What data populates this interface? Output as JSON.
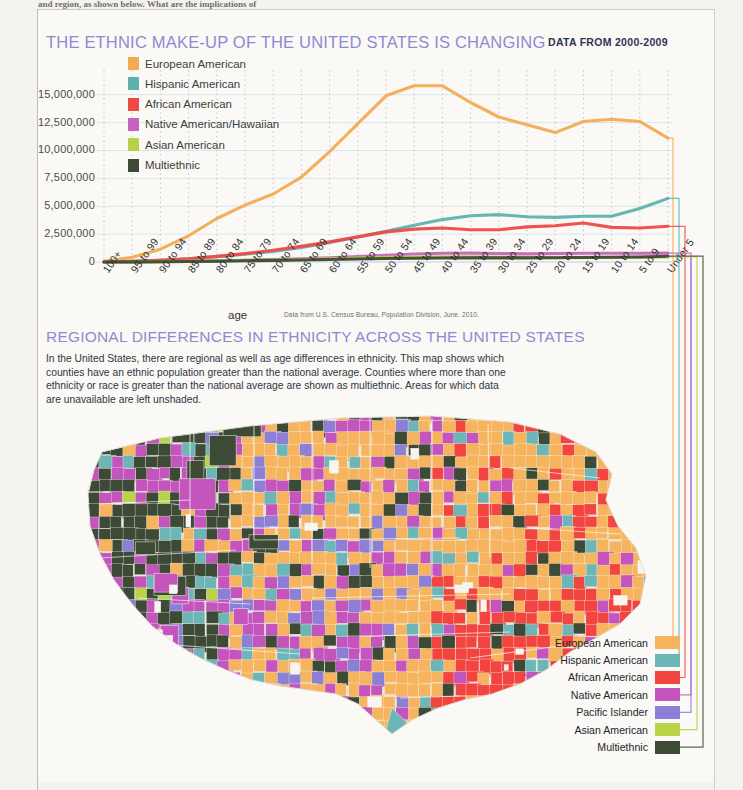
{
  "page": {
    "clipped_header_fragment": "and region, as shown below. What are the implications of"
  },
  "chart_section": {
    "title": "THE ETHNIC MAKE-UP OF THE UNITED STATES IS CHANGING",
    "subtitle": "DATA FROM 2000-2009",
    "axis_title": "age",
    "source_note": "Data from U.S. Census Bureau, Population Division, June, 2010.",
    "title_color": "#8f8ad0",
    "subtitle_color": "#2e3554"
  },
  "chart_data": {
    "type": "line",
    "title": "THE ETHNIC MAKE-UP OF THE UNITED STATES IS CHANGING",
    "xlabel": "age",
    "ylabel": "",
    "ylim": [
      0,
      16500000
    ],
    "grid": true,
    "legend_position": "top-left",
    "ytick_labels": [
      "15,000,000",
      "12,500,000",
      "10,000,000",
      "7,500,000",
      "5,000,000",
      "2,500,000",
      "0"
    ],
    "ytick_values": [
      15000000,
      12500000,
      10000000,
      7500000,
      5000000,
      2500000,
      0
    ],
    "categories": [
      "100+",
      "95 to 99",
      "90 to 94",
      "85 to 89",
      "80 to 84",
      "75 to 79",
      "70 to 74",
      "65 to 69",
      "60 to 64",
      "55 to 59",
      "50 to 54",
      "45 to 49",
      "40 to 44",
      "35 to 39",
      "30 to 34",
      "25 to 29",
      "20 to 24",
      "15 to 19",
      "10 to 14",
      "5 to 9",
      "Under 5"
    ],
    "series": [
      {
        "name": "European American",
        "color": "#f2ab52",
        "values": [
          60000,
          420000,
          1150000,
          2350000,
          3900000,
          5100000,
          6100000,
          7600000,
          9900000,
          12400000,
          14900000,
          15800000,
          15800000,
          14300000,
          13000000,
          12300000,
          11600000,
          12600000,
          12800000,
          12600000,
          11100000
        ]
      },
      {
        "name": "Hispanic American",
        "color": "#5bb3b0",
        "values": [
          15000,
          70000,
          160000,
          300000,
          480000,
          700000,
          950000,
          1300000,
          1750000,
          2250000,
          2750000,
          3300000,
          3800000,
          4150000,
          4250000,
          4050000,
          4000000,
          4100000,
          4100000,
          4800000,
          5700000
        ]
      },
      {
        "name": "African American",
        "color": "#ef4a46",
        "values": [
          12000,
          60000,
          150000,
          300000,
          500000,
          750000,
          1050000,
          1400000,
          1800000,
          2250000,
          2700000,
          2950000,
          3050000,
          2900000,
          2900000,
          3150000,
          3250000,
          3500000,
          3100000,
          3050000,
          3200000
        ]
      },
      {
        "name": "Native American/Hawaiian",
        "color": "#c862c0",
        "values": [
          3000,
          12000,
          30000,
          60000,
          100000,
          150000,
          215000,
          290000,
          380000,
          480000,
          600000,
          720000,
          790000,
          800000,
          760000,
          730000,
          760000,
          790000,
          790000,
          790000,
          800000
        ]
      },
      {
        "name": "Asian American",
        "color": "#b5d24a",
        "values": [
          2500,
          11000,
          28000,
          55000,
          90000,
          135000,
          185000,
          240000,
          300000,
          360000,
          410000,
          450000,
          470000,
          470000,
          450000,
          430000,
          420000,
          420000,
          420000,
          430000,
          450000
        ]
      },
      {
        "name": "Multiethnic",
        "color": "#3f4a34",
        "values": [
          2000,
          9000,
          22000,
          44000,
          72000,
          105000,
          140000,
          180000,
          225000,
          270000,
          310000,
          340000,
          360000,
          370000,
          370000,
          370000,
          380000,
          400000,
          420000,
          450000,
          520000
        ]
      }
    ]
  },
  "map_section": {
    "title": "REGIONAL DIFFERENCES IN ETHNICITY ACROSS THE UNITED STATES",
    "body": "In the United States, there are regional as well as age differences in ethnicity. This map shows which counties have an ethnic population greater than the national average. Counties where more than one ethnicity or race is greater than the national average are shown as multiethnic. Areas for which data are unavailable are left unshaded.",
    "legend": [
      {
        "label": "European American",
        "color": "#f6b45e"
      },
      {
        "label": "Hispanic American",
        "color": "#6db6b8"
      },
      {
        "label": "African American",
        "color": "#f3453f"
      },
      {
        "label": "Native American",
        "color": "#c455bd"
      },
      {
        "label": "Pacific Islander",
        "color": "#8d7fd6"
      },
      {
        "label": "Asian American",
        "color": "#b9d449"
      },
      {
        "label": "Multiethnic",
        "color": "#3d4a36"
      }
    ]
  }
}
